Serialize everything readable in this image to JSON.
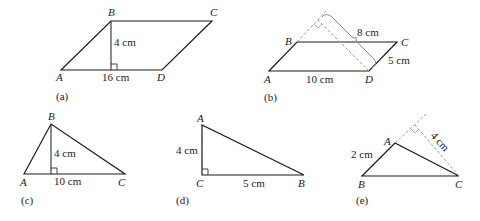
{
  "figures": {
    "a": {
      "caption": "(a)",
      "shape": "parallelogram",
      "vertices": {
        "A": "A",
        "B": "B",
        "C": "C",
        "D": "D"
      },
      "height_label": "4 cm",
      "base_label": "16 cm"
    },
    "b": {
      "caption": "(b)",
      "shape": "parallelogram",
      "vertices": {
        "A": "A",
        "B": "B",
        "C": "C",
        "D": "D"
      },
      "height_label": "8 cm",
      "side_label": "5 cm",
      "base_label": "10 cm"
    },
    "c": {
      "caption": "(c)",
      "shape": "triangle",
      "vertices": {
        "A": "A",
        "B": "B",
        "C": "C"
      },
      "height_label": "4 cm",
      "base_label": "10 cm"
    },
    "d": {
      "caption": "(d)",
      "shape": "right triangle",
      "vertices": {
        "A": "A",
        "B": "B",
        "C": "C"
      },
      "height_label": "4 cm",
      "base_label": "5 cm"
    },
    "e": {
      "caption": "(e)",
      "shape": "triangle",
      "vertices": {
        "A": "A",
        "B": "B",
        "C": "C"
      },
      "side_label": "2 cm",
      "height_label": "4 cm"
    }
  }
}
